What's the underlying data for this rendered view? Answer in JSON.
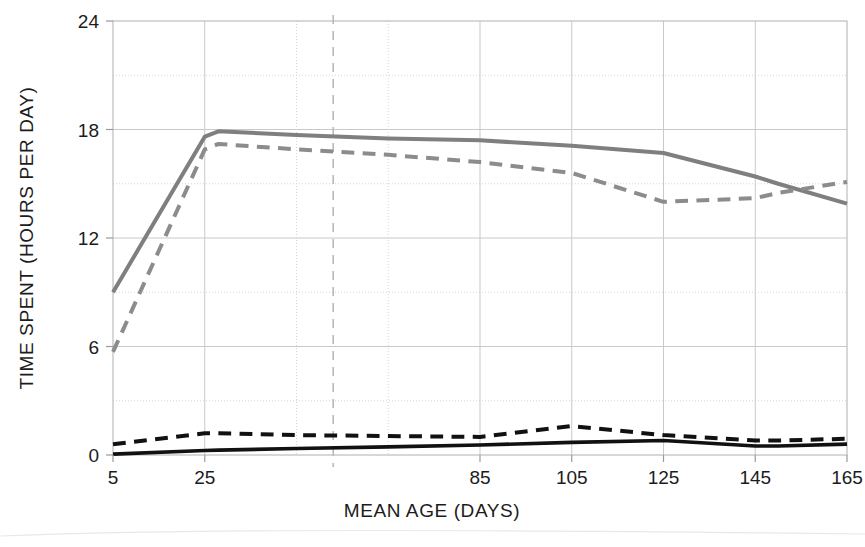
{
  "chart_data": {
    "type": "line",
    "title": "",
    "xlabel": "MEAN AGE (DAYS)",
    "ylabel": "TIME SPENT (HOURS PER DAY)",
    "xlim": [
      5,
      165
    ],
    "ylim": [
      0,
      24
    ],
    "xticks": [
      5,
      25,
      85,
      105,
      125,
      145,
      165
    ],
    "xtick_labels": [
      "5",
      "25",
      "85",
      "105",
      "125",
      "145",
      "165"
    ],
    "yticks": [
      0,
      6,
      12,
      18,
      24
    ],
    "ytick_labels": [
      "0",
      "6",
      "12",
      "18",
      "24"
    ],
    "grid": true,
    "legend": "none",
    "annotations": [
      {
        "name": "vertical-reference-line",
        "type": "vline",
        "x": 53,
        "style": "dashed",
        "color": "#b9b9b9",
        "label": ""
      }
    ],
    "x": [
      5,
      25,
      28,
      45,
      65,
      85,
      105,
      125,
      145,
      150,
      165
    ],
    "series": [
      {
        "name": "gray-solid",
        "color": "#7f7f7f",
        "style": "solid",
        "width": 4,
        "values": [
          9.0,
          17.6,
          17.9,
          17.7,
          17.5,
          17.4,
          17.1,
          16.7,
          15.4,
          15.0,
          13.9
        ]
      },
      {
        "name": "gray-dashed",
        "color": "#8c8c8c",
        "style": "dashed",
        "width": 4,
        "values": [
          5.7,
          16.9,
          17.2,
          16.9,
          16.6,
          16.2,
          15.6,
          14.0,
          14.2,
          14.5,
          15.1
        ]
      },
      {
        "name": "black-dashed",
        "color": "#111111",
        "style": "dashed",
        "width": 4,
        "values": [
          0.6,
          1.2,
          1.2,
          1.1,
          1.05,
          1.0,
          1.6,
          1.1,
          0.8,
          0.8,
          0.9
        ]
      },
      {
        "name": "black-solid",
        "color": "#111111",
        "style": "solid",
        "width": 3.6,
        "values": [
          0.05,
          0.25,
          0.27,
          0.36,
          0.45,
          0.55,
          0.7,
          0.8,
          0.5,
          0.5,
          0.6
        ]
      }
    ]
  }
}
